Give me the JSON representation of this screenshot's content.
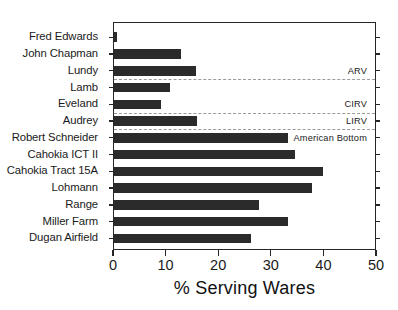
{
  "chart_data": {
    "type": "bar",
    "orientation": "horizontal",
    "title": "",
    "xlabel": "% Serving Wares",
    "ylabel": "",
    "xlim": [
      0,
      50
    ],
    "xticks": [
      0,
      10,
      20,
      30,
      40,
      50
    ],
    "grid": false,
    "legend": "none",
    "categories": [
      "Fred Edwards",
      "John Chapman",
      "Lundy",
      "Lamb",
      "Eveland",
      "Audrey",
      "Robert Schneider",
      "Cahokia ICT II",
      "Cahokia Tract 15A",
      "Lohmann",
      "Range",
      "Miller Farm",
      "Dugan Airfield"
    ],
    "values": [
      0.6,
      12.7,
      15.6,
      10.6,
      9.0,
      15.7,
      33.0,
      34.5,
      39.8,
      37.7,
      27.6,
      33.0,
      26.0
    ],
    "bar_color": "#2b2b2b",
    "annotations": [
      {
        "text": "ARV",
        "after_category": "Lundy"
      },
      {
        "text": "CIRV",
        "after_category": "Eveland"
      },
      {
        "text": "LIRV",
        "after_category": "Audrey"
      },
      {
        "text": "American Bottom",
        "after_category": "Robert Schneider"
      }
    ],
    "separators_after": [
      "Lundy",
      "Eveland",
      "Audrey"
    ],
    "separator_color": "#9a9a9a"
  },
  "axis": {
    "x_tick_labels": [
      "0",
      "10",
      "20",
      "30",
      "40",
      "50"
    ],
    "x_title": "% Serving Wares"
  },
  "regions": {
    "arv": "ARV",
    "cirv": "CIRV",
    "lirv": "LIRV",
    "american_bottom": "American Bottom"
  }
}
